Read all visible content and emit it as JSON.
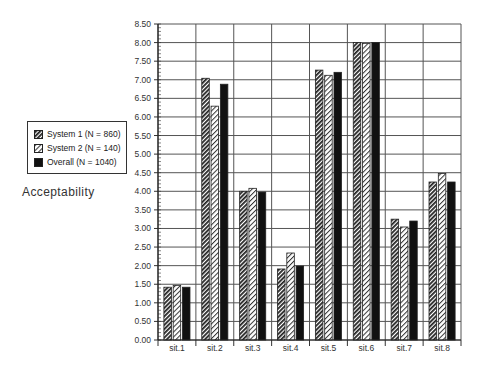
{
  "chart_data": {
    "type": "bar",
    "title": "",
    "xlabel": "",
    "ylabel": "Acceptability",
    "ylim": [
      0,
      8.5
    ],
    "yticks": [
      "0.00",
      "0.50",
      "1.00",
      "1.50",
      "2.00",
      "2.50",
      "3.00",
      "3.50",
      "4.00",
      "4.50",
      "5.00",
      "5.50",
      "6.00",
      "6.50",
      "7.00",
      "7.50",
      "8.00",
      "8.50"
    ],
    "grid": true,
    "legend_position": "left",
    "categories": [
      "sit.1",
      "sit.2",
      "sit.3",
      "sit.4",
      "sit.5",
      "sit.6",
      "sit.7",
      "sit.8"
    ],
    "series": [
      {
        "name": "System 1 (N = 860)",
        "pattern": "dense-diagonal",
        "color": "#444444",
        "values": [
          1.42,
          7.04,
          4.0,
          1.91,
          7.26,
          8.0,
          3.25,
          4.25
        ]
      },
      {
        "name": "System 2  (N = 140)",
        "pattern": "light-diagonal",
        "color": "#bbbbbb",
        "values": [
          1.47,
          6.29,
          4.08,
          2.34,
          7.12,
          7.98,
          3.04,
          4.48
        ]
      },
      {
        "name": "Overall (N = 1040)",
        "pattern": "solid",
        "color": "#111111",
        "values": [
          1.42,
          6.88,
          3.98,
          1.99,
          7.2,
          8.0,
          3.2,
          4.25
        ]
      }
    ]
  },
  "legend": {
    "items": [
      {
        "label": "System 1 (N = 860)"
      },
      {
        "label": "System 2  (N = 140)"
      },
      {
        "label": "Overall (N = 1040)"
      }
    ]
  },
  "axis": {
    "ylabel": "Acceptability"
  }
}
